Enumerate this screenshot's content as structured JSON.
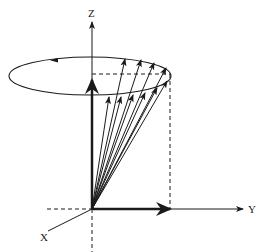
{
  "diagram": {
    "axes": {
      "z_label": "Z",
      "y_label": "Y",
      "x_label": "X"
    },
    "colors": {
      "stroke": "#1a1a1a",
      "background": "#ffffff"
    },
    "vector_count": 10
  }
}
